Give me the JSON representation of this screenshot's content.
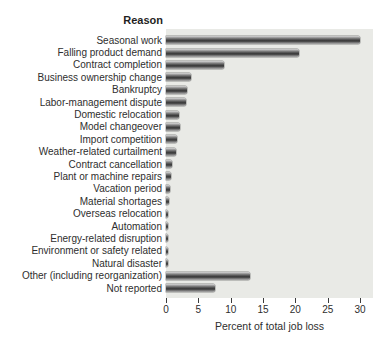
{
  "chart_data": {
    "type": "bar",
    "orientation": "horizontal",
    "title": "Reason",
    "xlabel": "Percent of total job loss",
    "xlim": [
      0,
      32
    ],
    "xticks": [
      0,
      5,
      10,
      15,
      20,
      25,
      30
    ],
    "grid": false,
    "legend_position": "none",
    "categories": [
      "Seasonal work",
      "Falling product demand",
      "Contract completion",
      "Business ownership change",
      "Bankruptcy",
      "Labor-management dispute",
      "Domestic relocation",
      "Model changeover",
      "Import competition",
      "Weather-related curtailment",
      "Contract cancellation",
      "Plant or machine repairs",
      "Vacation period",
      "Material shortages",
      "Overseas relocation",
      "Automation",
      "Energy-related disruption",
      "Environment or safety related",
      "Natural disaster",
      "Other (including reorganization)",
      "Not reported"
    ],
    "values": [
      30,
      20.5,
      9,
      3.9,
      3.3,
      3.1,
      2,
      2.2,
      1.7,
      1.6,
      0.9,
      0.7,
      0.6,
      0.5,
      0.35,
      0.3,
      0.25,
      0.25,
      0.25,
      13,
      7.6
    ],
    "colors": {
      "plot_bg": "#e9eae6",
      "bar_dark": "#3e3e3e",
      "bar_light": "#d8d8d8",
      "text": "#2e2e2e"
    }
  }
}
